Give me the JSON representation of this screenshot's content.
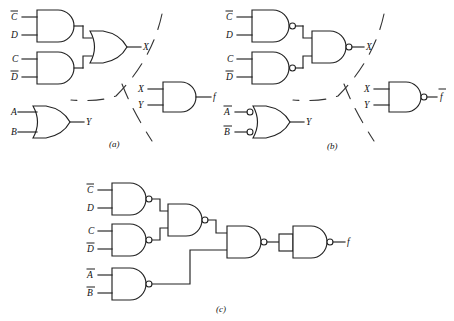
{
  "figure": {
    "type": "logic-circuit-diagram",
    "panels": [
      {
        "id": "a",
        "caption": "(a)",
        "realization": "AND-OR",
        "gates": [
          {
            "name": "and-cbar-d",
            "type": "AND",
            "inputs": [
              "Cbar",
              "D"
            ]
          },
          {
            "name": "and-c-dbar",
            "type": "AND",
            "inputs": [
              "C",
              "Dbar"
            ]
          },
          {
            "name": "or-x",
            "type": "OR",
            "inputs": [
              "and-cbar-d",
              "and-c-dbar"
            ],
            "output": "X"
          },
          {
            "name": "or-y",
            "type": "OR",
            "inputs": [
              "A",
              "B"
            ],
            "output": "Y"
          },
          {
            "name": "and-f",
            "type": "AND",
            "inputs": [
              "X",
              "Y"
            ],
            "output": "f"
          }
        ],
        "labels": {
          "i1": "C",
          "i1_bar": true,
          "i2": "D",
          "i2_bar": false,
          "i3": "C",
          "i3_bar": false,
          "i4": "D",
          "i4_bar": true,
          "i5": "A",
          "i5_bar": false,
          "i6": "B",
          "i6_bar": false,
          "x_out": "X",
          "y_out": "Y",
          "x_in": "X",
          "y_in": "Y",
          "f_out": "f",
          "f_bar": false
        }
      },
      {
        "id": "b",
        "caption": "(b)",
        "realization": "NAND with bubbled-input OR",
        "gates": [
          {
            "name": "nand-cbar-d",
            "type": "NAND",
            "inputs": [
              "Cbar",
              "D"
            ]
          },
          {
            "name": "nand-c-dbar",
            "type": "NAND",
            "inputs": [
              "C",
              "Dbar"
            ]
          },
          {
            "name": "nand-x",
            "type": "NAND",
            "inputs": [
              "nand-cbar-d",
              "nand-c-dbar"
            ],
            "output": "X"
          },
          {
            "name": "or-inverted-inputs-y",
            "type": "OR-INVERTED-INPUTS",
            "inputs": [
              "Abar",
              "Bbar"
            ],
            "output": "Y"
          },
          {
            "name": "nand-fbar",
            "type": "NAND",
            "inputs": [
              "X",
              "Y"
            ],
            "output": "fbar"
          }
        ],
        "labels": {
          "i1": "C",
          "i1_bar": true,
          "i2": "D",
          "i2_bar": false,
          "i3": "C",
          "i3_bar": false,
          "i4": "D",
          "i4_bar": true,
          "i5": "A",
          "i5_bar": true,
          "i6": "B",
          "i6_bar": true,
          "x_out": "X",
          "y_out": "Y",
          "x_in": "X",
          "y_in": "Y",
          "f_out": "f",
          "f_bar": true
        }
      },
      {
        "id": "c",
        "caption": "(c)",
        "realization": "all-NAND",
        "gates": [
          {
            "name": "nand-cbar-d",
            "type": "NAND",
            "inputs": [
              "Cbar",
              "D"
            ]
          },
          {
            "name": "nand-c-dbar",
            "type": "NAND",
            "inputs": [
              "C",
              "Dbar"
            ]
          },
          {
            "name": "nand-merge",
            "type": "NAND",
            "inputs": [
              "nand-cbar-d",
              "nand-c-dbar"
            ]
          },
          {
            "name": "nand-abar-bbar",
            "type": "NAND",
            "inputs": [
              "Abar",
              "Bbar"
            ]
          },
          {
            "name": "nand-combine",
            "type": "NAND",
            "inputs": [
              "nand-merge",
              "nand-abar-bbar"
            ]
          },
          {
            "name": "nand-inverter",
            "type": "NAND-INVERTER",
            "inputs": [
              "nand-combine"
            ],
            "output": "f"
          }
        ],
        "labels": {
          "i1": "C",
          "i1_bar": true,
          "i2": "D",
          "i2_bar": false,
          "i3": "C",
          "i3_bar": false,
          "i4": "D",
          "i4_bar": true,
          "i5": "A",
          "i5_bar": true,
          "i6": "B",
          "i6_bar": true,
          "f_out": "f",
          "f_bar": false
        }
      }
    ]
  }
}
